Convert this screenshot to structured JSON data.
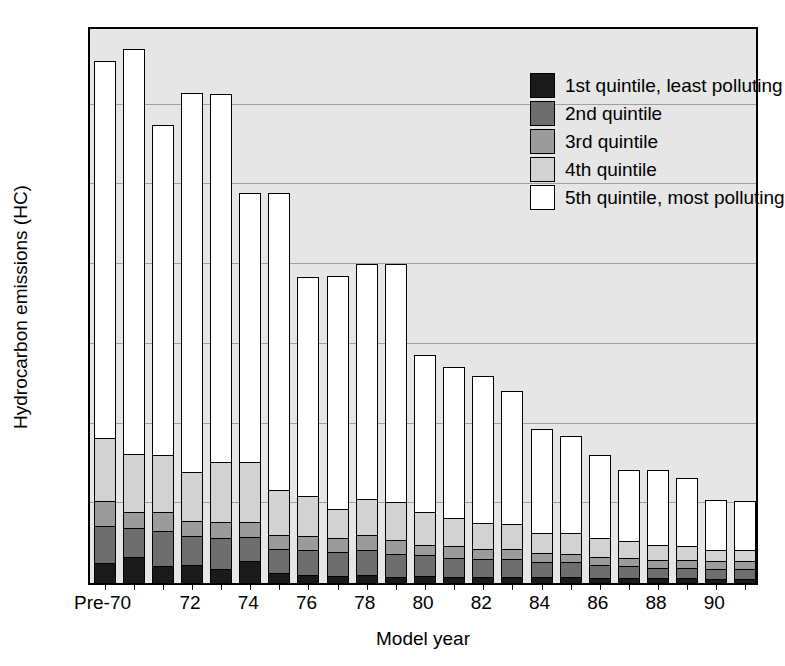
{
  "chart_data": {
    "type": "bar",
    "stacked": true,
    "title": "",
    "xlabel": "Model year",
    "ylabel": "Hydrocarbon emissions (HC)",
    "ylim": [
      0.0,
      0.7
    ],
    "yticks": [
      "0.0",
      "0.1",
      "0.2",
      "0.3",
      "0.4",
      "0.5",
      "0.6",
      "0.7"
    ],
    "ytick_values": [
      0.0,
      0.1,
      0.2,
      0.3,
      0.4,
      0.5,
      0.6,
      0.7
    ],
    "grid": true,
    "grid_axis": "y",
    "legend_position": "top-right",
    "categories": [
      "Pre-70",
      "70",
      "71",
      "72",
      "73",
      "74",
      "75",
      "76",
      "77",
      "78",
      "79",
      "80",
      "81",
      "82",
      "83",
      "84",
      "85",
      "86",
      "87",
      "88",
      "89",
      "90",
      "91"
    ],
    "tick_labels": [
      "Pre-70",
      "",
      "",
      "72",
      "",
      "74",
      "",
      "76",
      "",
      "78",
      "",
      "80",
      "",
      "82",
      "",
      "84",
      "",
      "86",
      "",
      "88",
      "",
      "90",
      ""
    ],
    "series": [
      {
        "name": "1st quintile, least polluting",
        "color": "#1a1a1a",
        "values": [
          0.025,
          0.033,
          0.021,
          0.022,
          0.018,
          0.028,
          0.012,
          0.01,
          0.009,
          0.01,
          0.008,
          0.009,
          0.008,
          0.007,
          0.008,
          0.007,
          0.007,
          0.006,
          0.006,
          0.006,
          0.006,
          0.005,
          0.005
        ]
      },
      {
        "name": "2nd quintile",
        "color": "#6e6e6e",
        "values": [
          0.047,
          0.036,
          0.044,
          0.037,
          0.039,
          0.03,
          0.031,
          0.032,
          0.03,
          0.032,
          0.029,
          0.026,
          0.023,
          0.023,
          0.022,
          0.019,
          0.019,
          0.016,
          0.015,
          0.013,
          0.013,
          0.013,
          0.013
        ]
      },
      {
        "name": "3rd quintile",
        "color": "#9b9b9b",
        "values": [
          0.031,
          0.02,
          0.024,
          0.019,
          0.02,
          0.019,
          0.017,
          0.017,
          0.018,
          0.018,
          0.017,
          0.013,
          0.015,
          0.013,
          0.013,
          0.012,
          0.01,
          0.011,
          0.011,
          0.01,
          0.01,
          0.009,
          0.009
        ]
      },
      {
        "name": "4th quintile",
        "color": "#d2d2d2",
        "values": [
          0.079,
          0.073,
          0.071,
          0.061,
          0.075,
          0.075,
          0.057,
          0.05,
          0.036,
          0.045,
          0.048,
          0.041,
          0.035,
          0.032,
          0.031,
          0.025,
          0.027,
          0.024,
          0.021,
          0.019,
          0.018,
          0.015,
          0.015
        ]
      },
      {
        "name": "5th quintile, most polluting",
        "color": "#ffffff",
        "values": [
          0.473,
          0.508,
          0.415,
          0.476,
          0.462,
          0.337,
          0.372,
          0.275,
          0.292,
          0.295,
          0.298,
          0.197,
          0.19,
          0.185,
          0.167,
          0.13,
          0.122,
          0.103,
          0.089,
          0.094,
          0.085,
          0.062,
          0.061
        ]
      }
    ],
    "totals": [
      0.655,
      0.67,
      0.575,
      0.615,
      0.614,
      0.489,
      0.489,
      0.384,
      0.385,
      0.4,
      0.4,
      0.286,
      0.271,
      0.26,
      0.241,
      0.193,
      0.185,
      0.16,
      0.142,
      0.142,
      0.132,
      0.104,
      0.103
    ]
  },
  "legend": {
    "items": [
      {
        "label": "1st quintile, least polluting",
        "color": "#1a1a1a"
      },
      {
        "label": "2nd quintile",
        "color": "#6e6e6e"
      },
      {
        "label": "3rd quintile",
        "color": "#9b9b9b"
      },
      {
        "label": "4th quintile",
        "color": "#d2d2d2"
      },
      {
        "label": "5th quintile, most polluting",
        "color": "#ffffff"
      }
    ]
  },
  "axes": {
    "y_title": "Hydrocarbon emissions (HC)",
    "x_title": "Model year"
  }
}
